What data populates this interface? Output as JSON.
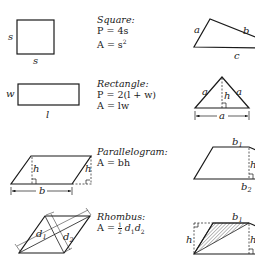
{
  "figures": [
    {
      "id": "square",
      "name": "Square:",
      "formulas": [
        "P = 4s",
        "A = s²"
      ],
      "labels": {
        "side_left": "s",
        "side_bottom": "s"
      }
    },
    {
      "id": "rectangle",
      "name": "Rectangle:",
      "formulas": [
        "P = 2(l + w)",
        "A = lw"
      ],
      "labels": {
        "width": "w",
        "length": "l"
      }
    },
    {
      "id": "parallelogram",
      "name": "Parallelogram:",
      "formulas": [
        "A = bh"
      ],
      "labels": {
        "height": "h",
        "base": "b"
      }
    },
    {
      "id": "rhombus",
      "name": "Rhombus:",
      "formulas": [
        "A = ½ d₁d₂"
      ],
      "labels": {
        "diag1": "d",
        "diag1_sub": "1",
        "diag2": "d",
        "diag2_sub": "2"
      },
      "formula_parts": {
        "lhs": "A =",
        "num": "1",
        "den": "2",
        "d": "d",
        "s1": "1",
        "s2": "2"
      }
    },
    {
      "id": "triangle",
      "labels": {
        "a": "a",
        "b": "b",
        "c": "c"
      }
    },
    {
      "id": "equilateral-triangle",
      "labels": {
        "left": "a",
        "right": "a",
        "height": "h",
        "base": "a"
      }
    },
    {
      "id": "trapezoid",
      "labels": {
        "top": "b",
        "top_sub": "1",
        "height": "h",
        "bottom": "b",
        "bottom_sub": "2"
      }
    },
    {
      "id": "trapezoid-area",
      "labels": {
        "top": "b",
        "top_sub": "1",
        "height_left": "h",
        "height_right": "h"
      }
    }
  ],
  "text": {
    "square_name": "Square:",
    "square_p": "P = 4s",
    "square_a_pre": "A = s",
    "square_a_exp": "2",
    "rect_name": "Rectangle:",
    "rect_p": "P = 2(l + w)",
    "rect_a": "A = lw",
    "para_name": "Parallelogram:",
    "para_a": "A = bh",
    "rhombus_name": "Rhombus:"
  },
  "colors": {
    "ink": "#1a1a1a",
    "hatch": "#8a8a8a",
    "background": "#ffffff"
  }
}
